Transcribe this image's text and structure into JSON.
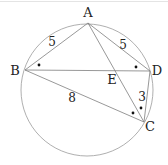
{
  "figure": {
    "type": "inscribed quadrilateral with diagonals",
    "circle": {
      "cx": 87,
      "cy": 90,
      "r": 66
    },
    "points": {
      "A": {
        "label": "A",
        "x": 88,
        "y": 23,
        "lx": 88,
        "ly": 17
      },
      "B": {
        "label": "B",
        "x": 25,
        "y": 70,
        "lx": 15,
        "ly": 75
      },
      "C": {
        "label": "C",
        "x": 144,
        "y": 122,
        "lx": 150,
        "ly": 131
      },
      "D": {
        "label": "D",
        "x": 150,
        "y": 71,
        "lx": 157,
        "ly": 75
      },
      "E": {
        "label": "E",
        "x": 115,
        "y": 71,
        "lx": 112,
        "ly": 84
      }
    },
    "segments": [
      "AB",
      "AD",
      "AC",
      "BD",
      "BC",
      "DC"
    ],
    "lengths": {
      "AB": {
        "value": "5",
        "x": 52,
        "y": 46
      },
      "AD": {
        "value": "5",
        "x": 123,
        "y": 49
      },
      "BC": {
        "value": "8",
        "x": 72,
        "y": 102
      },
      "DC": {
        "value": "3",
        "x": 142,
        "y": 101
      }
    },
    "angle_marks": [
      {
        "name": "angle-ABD-mark",
        "x": 39,
        "y": 65
      },
      {
        "name": "angle-ADB-mark",
        "x": 136,
        "y": 67
      },
      {
        "name": "angle-ACD-mark",
        "x": 141,
        "y": 108
      },
      {
        "name": "angle-ACB-mark",
        "x": 133,
        "y": 113
      }
    ],
    "colors": {
      "line": "#8a8a8a",
      "text": "#222222",
      "dot": "#111111"
    }
  }
}
